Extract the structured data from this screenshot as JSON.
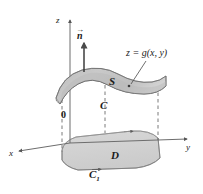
{
  "figure": {
    "axes": {
      "z_label": "z",
      "x_label": "x",
      "y_label": "y",
      "origin_label": "0"
    },
    "labels": {
      "normal_vector": "n",
      "surface": "S",
      "surface_equation": "z = g(x, y)",
      "boundary_curve_upper": "C",
      "region": "D",
      "boundary_curve_lower": "C",
      "boundary_curve_lower_subscript": "1"
    },
    "colors": {
      "surface_fill": "#c3c3c3",
      "surface_fill_light": "#d6d6d6",
      "region_fill": "#d2d2d2",
      "stroke": "#4a4a4a",
      "axis": "#555555",
      "dashed": "#6b6b6b",
      "text": "#1a1a1a",
      "background": "#ffffff"
    }
  }
}
